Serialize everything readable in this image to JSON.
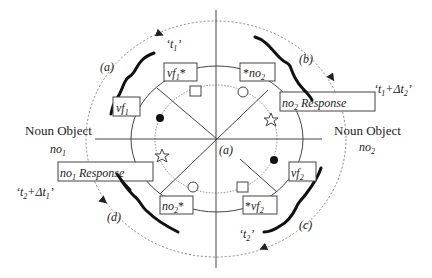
{
  "diagram": {
    "center_label": "(a)",
    "quadrant_labels": {
      "a": "(a)",
      "b": "(b)",
      "c": "(c)",
      "d": "(d)"
    },
    "time_labels": {
      "t1": "‘t1’",
      "t1_dt2": "‘t1+Δt2’",
      "t2": "‘t2’",
      "t2_dt1": "‘t2+Δt1’"
    },
    "time_label_parts": {
      "t1": {
        "open": "‘t",
        "sub": "1",
        "close": "’"
      },
      "t1_dt2": {
        "open": "‘t",
        "sub1": "1",
        "mid": "+Δt",
        "sub2": "2",
        "close": "’"
      },
      "t2": {
        "open": "‘t",
        "sub": "2",
        "close": "’"
      },
      "t2_dt1": {
        "open": "‘t",
        "sub1": "2",
        "mid": "+Δt",
        "sub2": "1",
        "close": "’"
      }
    },
    "noun_objects": {
      "left": {
        "title": "Noun Object",
        "sym": "no",
        "sub": "1"
      },
      "right": {
        "title": "Noun Object",
        "sym": "no",
        "sub": "2"
      }
    },
    "boxes": {
      "vf1": {
        "sym": "vf",
        "sub": "1",
        "suffix": ""
      },
      "vf1_star": {
        "sym": "vf",
        "sub": "1",
        "suffix": "*"
      },
      "star_no2": {
        "prefix": "*",
        "sym": "no",
        "sub": "2"
      },
      "no2_response": {
        "sym": "no",
        "sub": "2",
        "suffix": " Response"
      },
      "no1_response": {
        "sym": "no",
        "sub": "1",
        "suffix": " Response"
      },
      "no2_star": {
        "sym": "no",
        "sub": "2",
        "suffix": "*"
      },
      "star_vf2": {
        "prefix": "*",
        "sym": "vf",
        "sub": "2"
      },
      "vf2": {
        "sym": "vf",
        "sub": "2",
        "suffix": ""
      }
    },
    "markers": [
      "filled-circle",
      "open-circle",
      "open-square",
      "open-star"
    ],
    "colors": {
      "ink": "#222222",
      "dashed": "#888888",
      "background": "#ffffff"
    }
  }
}
